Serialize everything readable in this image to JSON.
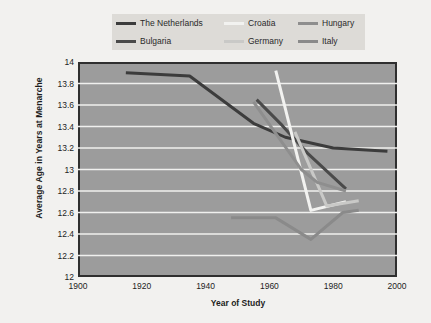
{
  "chart_data": {
    "type": "line",
    "title": "",
    "xlabel": "Year of Study",
    "ylabel": "Average Age in Years at Menarche",
    "xlim": [
      1900,
      2000
    ],
    "ylim": [
      12,
      14
    ],
    "xticks": [
      1900,
      1920,
      1940,
      1960,
      1980,
      2000
    ],
    "yticks": [
      "12",
      "12.2",
      "12.4",
      "12.6",
      "12.8",
      "13",
      "13.2",
      "13.4",
      "13.6",
      "13.8",
      "14"
    ],
    "grid": "horizontal",
    "legend_position": "top-center",
    "plot_background": "#9c9c9c",
    "gridline_color": "#f0f0ee",
    "series": [
      {
        "name": "The Netherlands",
        "color": "#3c3c3c",
        "x": [
          1915,
          1935,
          1955,
          1965,
          1980,
          1997
        ],
        "y": [
          13.9,
          13.87,
          13.43,
          13.3,
          13.2,
          13.17
        ]
      },
      {
        "name": "Bulgaria",
        "color": "#4a4a4a",
        "x": [
          1956,
          1964,
          1972,
          1984
        ],
        "y": [
          13.65,
          13.41,
          13.15,
          12.82
        ]
      },
      {
        "name": "Croatia",
        "color": "#f2f2f0",
        "x": [
          1962,
          1973,
          1984
        ],
        "y": [
          13.92,
          12.62,
          12.7
        ]
      },
      {
        "name": "Germany",
        "color": "#c9c9c7",
        "x": [
          1968,
          1978,
          1988
        ],
        "y": [
          13.35,
          12.66,
          12.71
        ]
      },
      {
        "name": "Hungary",
        "color": "#8e8e8e",
        "x": [
          1955,
          1970,
          1975,
          1984
        ],
        "y": [
          13.63,
          13.0,
          12.88,
          12.8
        ]
      },
      {
        "name": "Italy",
        "color": "#8a8a8a",
        "x": [
          1948,
          1962,
          1973,
          1983,
          1988
        ],
        "y": [
          12.55,
          12.55,
          12.35,
          12.6,
          12.62
        ]
      }
    ]
  },
  "legend": {
    "items": [
      {
        "label": "The Netherlands",
        "color": "#3c3c3c"
      },
      {
        "label": "Croatia",
        "color": "#f2f2f0"
      },
      {
        "label": "Hungary",
        "color": "#8e8e8e"
      },
      {
        "label": "Bulgaria",
        "color": "#4a4a4a"
      },
      {
        "label": "Germany",
        "color": "#c9c9c7"
      },
      {
        "label": "Italy",
        "color": "#8a8a8a"
      }
    ]
  },
  "axes": {
    "y_title": "Average Age in Years at Menarche",
    "x_title": "Year of Study",
    "y_tick_labels": [
      "14",
      "13.8",
      "13.6",
      "13.4",
      "13.2",
      "13",
      "12.8",
      "12.6",
      "12.4",
      "12.2",
      "12"
    ],
    "x_tick_labels": [
      "1900",
      "1920",
      "1940",
      "1960",
      "1980",
      "2000"
    ]
  }
}
